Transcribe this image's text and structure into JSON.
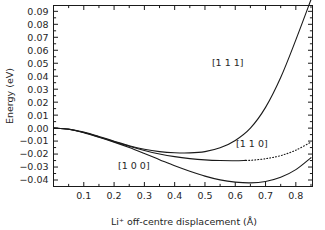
{
  "chart_data": {
    "type": "line",
    "title": "",
    "xlabel": "Li⁺ off-centre displacement (Å)",
    "ylabel": "Energy (eV)",
    "xlim": [
      0.0,
      0.855
    ],
    "ylim": [
      -0.045,
      0.0945
    ],
    "grid": false,
    "legend_position": "inline-annotations",
    "xticks": [
      0.1,
      0.2,
      0.3,
      0.4,
      0.5,
      0.6,
      0.7,
      0.8
    ],
    "xtick_labels": [
      "0.1",
      "0.2",
      "0.3",
      "0.4",
      "0.5",
      "0.6",
      "0.7",
      "0.8"
    ],
    "yticks": [
      -0.04,
      -0.03,
      -0.02,
      -0.01,
      0.0,
      0.01,
      0.02,
      0.03,
      0.04,
      0.05,
      0.06,
      0.07,
      0.08,
      0.09
    ],
    "ytick_labels": [
      "−0.04",
      "−0.03",
      "−0.02",
      "−0.01",
      "0.00",
      "0.01",
      "0.02",
      "0.03",
      "0.04",
      "0.05",
      "0.06",
      "0.07",
      "0.08",
      "0.09"
    ],
    "x": [
      0.0,
      0.05,
      0.1,
      0.15,
      0.2,
      0.25,
      0.3,
      0.35,
      0.4,
      0.45,
      0.5,
      0.55,
      0.6,
      0.65,
      0.7,
      0.75,
      0.8,
      0.85
    ],
    "series": [
      {
        "name": "[1 1 1]",
        "style": "solid",
        "label": "[1 1 1]",
        "values": [
          0.0,
          -0.0008,
          -0.0031,
          -0.0064,
          -0.0101,
          -0.0136,
          -0.0163,
          -0.0181,
          -0.019,
          -0.0191,
          -0.0181,
          -0.0152,
          -0.0095,
          0.0,
          0.016,
          0.039,
          0.068,
          0.099
        ],
        "minimum": {
          "x": 0.46,
          "y": -0.0191
        }
      },
      {
        "name": "[1 1 0]",
        "style": "solid-then-dotted",
        "label": "[1 1 0]",
        "dotted_from_x": 0.635,
        "values": [
          0.0,
          -0.0009,
          -0.0034,
          -0.0068,
          -0.0104,
          -0.014,
          -0.0172,
          -0.0199,
          -0.022,
          -0.0235,
          -0.0245,
          -0.025,
          -0.0251,
          -0.0248,
          -0.0236,
          -0.0212,
          -0.017,
          -0.0108
        ],
        "minimum": {
          "x": 0.6,
          "y": -0.0251
        }
      },
      {
        "name": "[1 0 0]",
        "style": "solid",
        "label": "[1 0 0]",
        "values": [
          0.0,
          -0.0009,
          -0.0035,
          -0.007,
          -0.0108,
          -0.015,
          -0.0196,
          -0.0243,
          -0.029,
          -0.0332,
          -0.037,
          -0.0399,
          -0.0416,
          -0.0422,
          -0.0411,
          -0.0379,
          -0.032,
          -0.0228
        ],
        "minimum": {
          "x": 0.625,
          "y": -0.0422
        }
      }
    ],
    "annotations": [
      {
        "text": "[1 1 1]",
        "x": 0.575,
        "y": 0.0505
      },
      {
        "text": "[1 1 0]",
        "x": 0.655,
        "y": -0.0122
      },
      {
        "text": "[1 0 0]",
        "x": 0.265,
        "y": -0.029
      }
    ],
    "colors": {
      "line": "#1a1a1a",
      "background": "#ffffff",
      "text": "#262626"
    }
  }
}
